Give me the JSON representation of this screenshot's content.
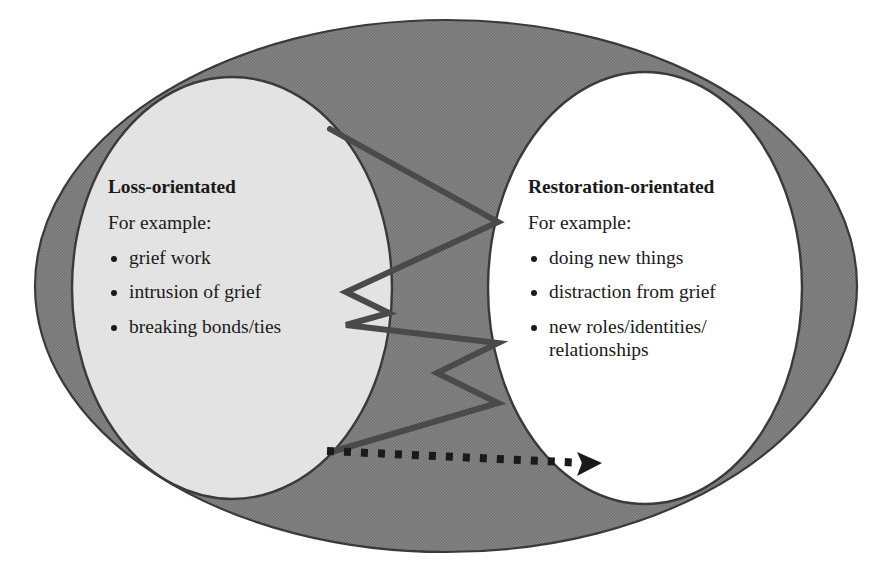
{
  "diagram": {
    "colors": {
      "outer_ring_fill": "#808080",
      "left_circle_fill": "#e4e4e4",
      "right_circle_fill": "#ffffff",
      "outline": "#3a3a3a",
      "line": "#4a4a4a",
      "text": "#1a1a1a",
      "background": "#ffffff"
    },
    "shapes": {
      "outer_ellipse_label": "everyday-life-experience-ellipse",
      "left_circle_label": "loss-orientated-circle",
      "right_circle_label": "restoration-orientated-circle",
      "oscillation_line_label": "oscillation-zigzag-line",
      "progression_arrow_label": "dotted-progression-arrow"
    },
    "left": {
      "heading": "Loss-orientated",
      "subheading": "For example:",
      "bullets": [
        "grief work",
        "intrusion of grief",
        "breaking bonds/ties"
      ]
    },
    "right": {
      "heading": "Restoration-orientated",
      "subheading": "For example:",
      "bullets": [
        "doing new things",
        "distraction from grief",
        "new roles/identities/"
      ],
      "bullet_continuation": "relationships"
    }
  }
}
